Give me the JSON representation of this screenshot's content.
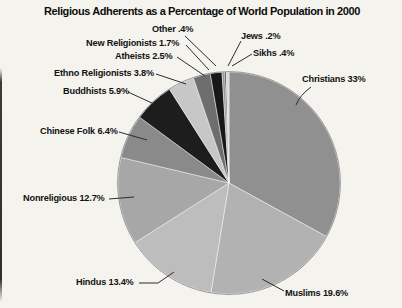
{
  "title": "Religious Adherents as a Percentage of World Population in 2000",
  "chart_data": {
    "type": "pie",
    "title": "Religious Adherents as a Percentage of World Population in 2000",
    "start_angle_deg": 0,
    "direction": "clockwise",
    "unit": "% of world population",
    "total": 100,
    "slices": [
      {
        "id": "christians",
        "label": "Christians",
        "value": 33,
        "display": "Christians 33%",
        "color": "#909090"
      },
      {
        "id": "muslims",
        "label": "Muslims",
        "value": 19.6,
        "display": "Muslims 19.6%",
        "color": "#b2b2b2"
      },
      {
        "id": "hindus",
        "label": "Hindus",
        "value": 13.4,
        "display": "Hindus 13.4%",
        "color": "#bdbdbd"
      },
      {
        "id": "nonreligious",
        "label": "Nonreligious",
        "value": 12.7,
        "display": "Nonreligious 12.7%",
        "color": "#a7a7a7"
      },
      {
        "id": "chinese-folk",
        "label": "Chinese Folk",
        "value": 6.4,
        "display": "Chinese Folk 6.4%",
        "color": "#8a8a8a"
      },
      {
        "id": "buddhists",
        "label": "Buddhists",
        "value": 5.9,
        "display": "Buddhists 5.9%",
        "color": "#1d1d1d"
      },
      {
        "id": "ethno-religionists",
        "label": "Ethno Religionists",
        "value": 3.8,
        "display": "Ethno Religionists 3.8%",
        "color": "#c7c7c7"
      },
      {
        "id": "atheists",
        "label": "Atheists",
        "value": 2.5,
        "display": "Atheists 2.5%",
        "color": "#6e6e6e"
      },
      {
        "id": "new-religionists",
        "label": "New Religionists",
        "value": 1.7,
        "display": "New Religionists 1.7%",
        "color": "#181818"
      },
      {
        "id": "other",
        "label": "Other",
        "value": 0.4,
        "display": "Other .4%",
        "color": "#969696"
      },
      {
        "id": "jews",
        "label": "Jews",
        "value": 0.2,
        "display": "Jews .2%",
        "color": "#141414"
      },
      {
        "id": "sikhs",
        "label": "Sikhs",
        "value": 0.4,
        "display": "Sikhs .4%",
        "color": "#d8d8d8"
      }
    ]
  }
}
